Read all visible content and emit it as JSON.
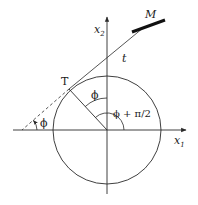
{
  "figure": {
    "type": "geometry-diagram",
    "colors": {
      "stroke": "#2a2a2a",
      "background": "#ffffff"
    },
    "axes": {
      "x": {
        "label": "x",
        "subscript": "1"
      },
      "y": {
        "label": "x",
        "subscript": "2"
      }
    },
    "points": {
      "tangent_point": "T",
      "manipulator": "M"
    },
    "lines": {
      "tangent_label": "t"
    },
    "angles": {
      "at_axis": "ϕ",
      "at_center": "ϕ",
      "obtuse": "ϕ + π/2"
    }
  }
}
